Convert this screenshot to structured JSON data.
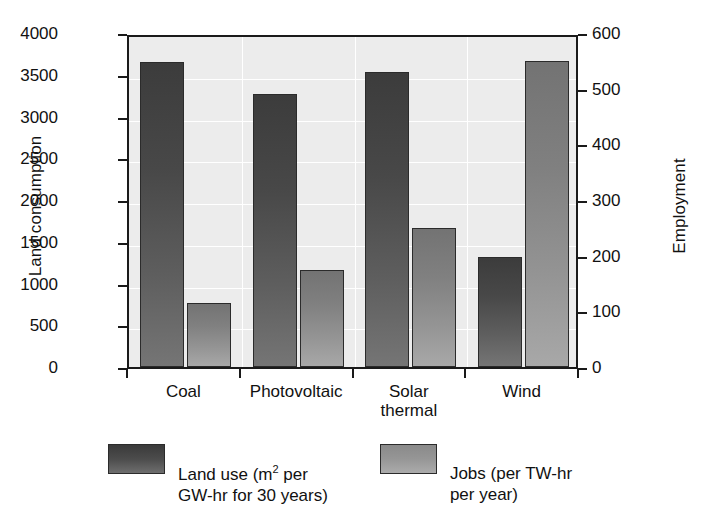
{
  "chart_data": {
    "type": "bar",
    "title": "",
    "categories": [
      "Coal",
      "Photovoltaic",
      "Solar\nthermal",
      "Wind"
    ],
    "series": [
      {
        "name": "Land use (m2 per GW-hr for 30 years)",
        "axis": "left",
        "color": "#4a4a4a",
        "values": [
          3650,
          3270,
          3530,
          1320
        ]
      },
      {
        "name": "Jobs (per TW-hr per year)",
        "axis": "right",
        "color": "#969696",
        "values": [
          115,
          175,
          250,
          550
        ]
      }
    ],
    "xlabel": "",
    "ylabel": "Land consumption",
    "ylabel_right": "Employment",
    "ylim": [
      0,
      4000
    ],
    "ylim_right": [
      0,
      600
    ],
    "yticks": [
      0,
      500,
      1000,
      1500,
      2000,
      2500,
      3000,
      3500,
      4000
    ],
    "yticks_right": [
      0,
      100,
      200,
      300,
      400,
      500,
      600
    ],
    "ytick_labels": [
      "0",
      "500",
      "1000",
      "1500",
      "2000",
      "2500",
      "3000",
      "3500",
      "4000"
    ],
    "ytick_labels_right": [
      "0",
      "100",
      "200",
      "300",
      "400",
      "500",
      "600"
    ],
    "grid": true,
    "legend_position": "bottom",
    "plot_background": "#ececec",
    "gridline_color": "#ffffff"
  },
  "axes": {
    "left_title": "Land consumption",
    "right_title": "Employment"
  },
  "legend": {
    "items": [
      {
        "label": "Land use (m",
        "sup": "2",
        "label_rest": " per\nGW-hr for 30 years)",
        "swatch": "dark-gradient-swatch"
      },
      {
        "label": "Jobs (per TW-hr",
        "sup": "",
        "label_rest": "\nper year)",
        "swatch": "light-gradient-swatch"
      }
    ]
  }
}
